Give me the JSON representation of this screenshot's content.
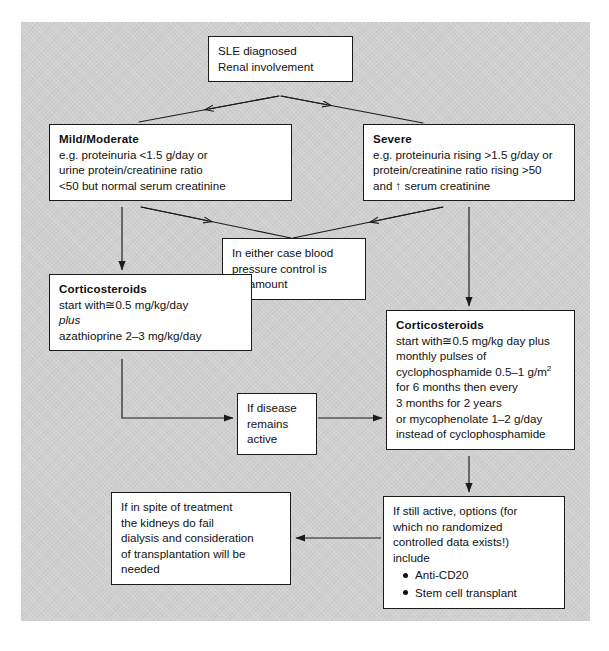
{
  "figure": {
    "type": "flowchart",
    "panel_background": "#cfcfcf",
    "node_background": "#ffffff",
    "line_color": "#1b1b1b"
  },
  "nodes": {
    "start": {
      "name": "sle-diagnosed",
      "lines": [
        "SLE diagnosed",
        "Renal involvement"
      ]
    },
    "mild": {
      "name": "mild-moderate",
      "title": "Mild/Moderate",
      "lines": [
        "e.g. proteinuria <1.5 g/day or",
        "urine protein/creatinine ratio",
        "<50 but normal serum creatinine"
      ]
    },
    "severe": {
      "name": "severe",
      "title": "Severe",
      "lines": [
        "e.g. proteinuria rising >1.5 g/day or",
        "protein/creatinine ratio rising >50",
        "and ↑ serum creatinine"
      ]
    },
    "either": {
      "name": "blood-pressure-control",
      "lines": [
        "In  either case blood",
        "pressure control is",
        "paramount"
      ]
    },
    "cortico_left": {
      "name": "corticosteroids-mild",
      "title": "Corticosteroids",
      "line1": "start with≅0.5 mg/kg/day",
      "line2_italic": "plus",
      "line3": "azathioprine 2–3 mg/kg/day"
    },
    "cortico_right": {
      "name": "corticosteroids-severe",
      "title": "Corticosteroids",
      "lines": [
        "start with≅0.5 mg/kg day plus",
        "monthly pulses of",
        "for 6 months then every",
        "3 months for 2 years",
        "or mycophenolate 1–2 g/day",
        "instead of cyclophosphamide"
      ],
      "cyclo_line_prefix": "cyclophosphamide 0.5–1 g/m",
      "cyclo_line_sup": "2"
    },
    "disease_active": {
      "name": "if-disease-remains-active",
      "lines": [
        "If disease",
        "remains",
        "active"
      ]
    },
    "kidneys_fail": {
      "name": "kidneys-fail-dialysis",
      "lines": [
        "If in  spite of treatment",
        "the kidneys do fail",
        "dialysis and consideration",
        "of transplantation will be",
        "needed"
      ]
    },
    "still_active": {
      "name": "if-still-active-options",
      "lines": [
        "If still active, options (for",
        "which no randomized",
        "controlled data exists!)",
        "include"
      ],
      "bullets": [
        "Anti-CD20",
        "Stem cell transplant"
      ]
    }
  },
  "edges": [
    {
      "from": "start",
      "to": "mild",
      "style": "diagonal-arrow"
    },
    {
      "from": "start",
      "to": "severe",
      "style": "diagonal-arrow"
    },
    {
      "from": "mild",
      "to": "either",
      "style": "diagonal-arrow"
    },
    {
      "from": "severe",
      "to": "either",
      "style": "diagonal-arrow"
    },
    {
      "from": "mild",
      "to": "cortico_left",
      "style": "vertical-arrow"
    },
    {
      "from": "severe",
      "to": "cortico_right",
      "style": "vertical-arrow"
    },
    {
      "from": "cortico_left",
      "to": "disease_active",
      "style": "elbow-arrow"
    },
    {
      "from": "disease_active",
      "to": "cortico_right",
      "style": "horizontal-arrow"
    },
    {
      "from": "cortico_right",
      "to": "still_active",
      "style": "vertical-arrow"
    },
    {
      "from": "still_active",
      "to": "kidneys_fail",
      "style": "horizontal-arrow-left"
    }
  ]
}
